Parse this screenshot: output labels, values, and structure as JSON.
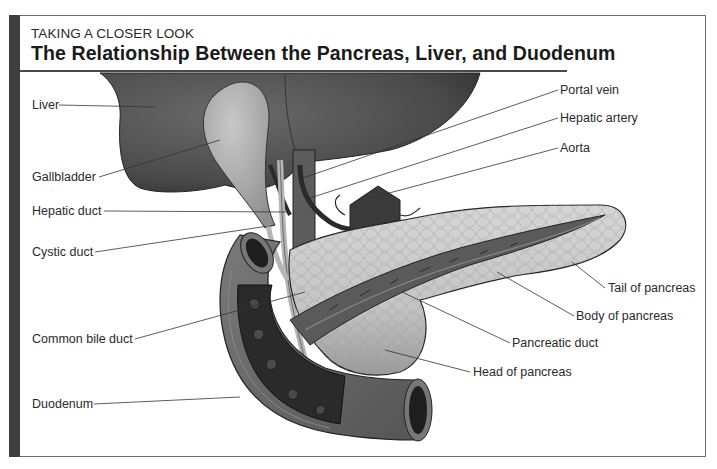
{
  "header": {
    "kicker": "TAKING A CLOSER LOOK",
    "title": "The Relationship Between the Pancreas, Liver, and Duodenum"
  },
  "labels_left": [
    {
      "id": "liver",
      "text": "Liver"
    },
    {
      "id": "gallbladder",
      "text": "Gallbladder"
    },
    {
      "id": "hepatic-duct",
      "text": "Hepatic duct"
    },
    {
      "id": "cystic-duct",
      "text": "Cystic duct"
    },
    {
      "id": "common-bile-duct",
      "text": "Common bile duct"
    },
    {
      "id": "duodenum",
      "text": "Duodenum"
    }
  ],
  "labels_right": [
    {
      "id": "portal-vein",
      "text": "Portal vein"
    },
    {
      "id": "hepatic-artery",
      "text": "Hepatic artery"
    },
    {
      "id": "aorta",
      "text": "Aorta"
    },
    {
      "id": "tail-of-pancreas",
      "text": "Tail of pancreas"
    },
    {
      "id": "body-of-pancreas",
      "text": "Body of pancreas"
    },
    {
      "id": "pancreatic-duct",
      "text": "Pancreatic duct"
    },
    {
      "id": "head-of-pancreas",
      "text": "Head of pancreas"
    }
  ],
  "colors": {
    "accent_bar": "#3f3f3f",
    "frame": "#6d6d6d",
    "liver": "#4a4a4a",
    "gallbladder": "#a8a8a8",
    "pancreas": "#c9c9c9",
    "duodenum": "#6a6a6a"
  }
}
